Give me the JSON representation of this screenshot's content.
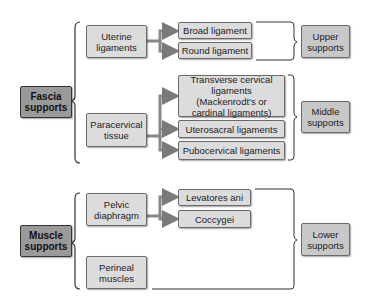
{
  "diagram": {
    "fascia": {
      "label": "Fascia supports",
      "uterine": "Uterine ligaments",
      "paracervical": "Paracervical tissue",
      "broad": "Broad ligament",
      "round": "Round ligament",
      "transverse": "Transverse cervical ligaments (Mackenrodt's or cardinal ligaments)",
      "uterosacral": "Uterosacral ligaments",
      "pubocervical": "Pubocervical ligaments",
      "upper": "Upper supports",
      "middle": "Middle supports"
    },
    "muscle": {
      "label": "Muscle supports",
      "pelvic": "Pelvic diaphragm",
      "perineal": "Perineal muscles",
      "levatores": "Levatores ani",
      "coccygei": "Coccygei",
      "lower": "Lower supports"
    }
  },
  "colors": {
    "root_fill": "#9a9a9a",
    "node_fill": "#dcdcdc",
    "result_fill": "#c8c8c8",
    "line": "#333333",
    "arrow": "#888888"
  }
}
